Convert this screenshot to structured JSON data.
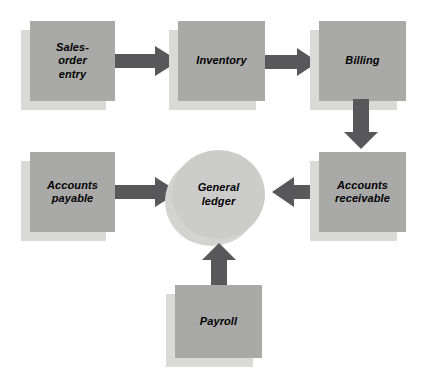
{
  "diagram": {
    "background_color": "#ffffff",
    "node_fill": "#a9aaa8",
    "node_shadow": "#d9dad7",
    "ellipse_fill": "#cccdca",
    "arrow_color": "#58585a",
    "nodes": [
      {
        "id": "sales_order_entry",
        "label": "Sales-\norder\nentry",
        "shape": "rectangle"
      },
      {
        "id": "inventory",
        "label": "Inventory",
        "shape": "rectangle"
      },
      {
        "id": "billing",
        "label": "Billing",
        "shape": "rectangle"
      },
      {
        "id": "accounts_payable",
        "label": "Accounts\npayable",
        "shape": "rectangle"
      },
      {
        "id": "general_ledger",
        "label": "General\nledger",
        "shape": "ellipse"
      },
      {
        "id": "accounts_receivable",
        "label": "Accounts\nreceivable",
        "shape": "rectangle"
      },
      {
        "id": "payroll",
        "label": "Payroll",
        "shape": "rectangle"
      }
    ],
    "arrows": [
      {
        "id": "sales-to-inventory",
        "from": "sales_order_entry",
        "to": "inventory",
        "direction": "right"
      },
      {
        "id": "inventory-to-billing",
        "from": "inventory",
        "to": "billing",
        "direction": "right"
      },
      {
        "id": "billing-to-accounts-receivable",
        "from": "billing",
        "to": "accounts_receivable",
        "direction": "down"
      },
      {
        "id": "accounts-payable-to-general-ledger",
        "from": "accounts_payable",
        "to": "general_ledger",
        "direction": "right"
      },
      {
        "id": "accounts-receivable-to-general-ledger",
        "from": "accounts_receivable",
        "to": "general_ledger",
        "direction": "left"
      },
      {
        "id": "payroll-to-general-ledger",
        "from": "payroll",
        "to": "general_ledger",
        "direction": "up"
      }
    ]
  }
}
